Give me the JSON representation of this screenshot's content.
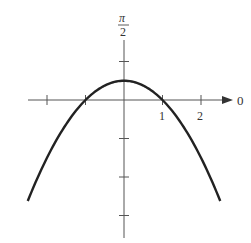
{
  "chart_data": {
    "type": "line",
    "title": "",
    "coordinate_system": "polar",
    "equation_hint": "r = 1/(1 + sin θ)",
    "polar_axis_label": "0",
    "vertical_axis_label": {
      "numerator": "π",
      "denominator": "2"
    },
    "x_tick_labels": [
      "1",
      "2"
    ],
    "x_ticks": [
      -2,
      -1,
      1,
      2
    ],
    "y_ticks": [
      1,
      -1,
      -2,
      -3
    ],
    "xlim": [
      -2.5,
      2.5
    ],
    "ylim": [
      -3.5,
      1.6
    ],
    "series": [
      {
        "name": "curve",
        "x": [
          -2.5,
          -2,
          -1.5,
          -1,
          -0.5,
          0,
          0.5,
          1,
          1.5,
          2,
          2.5
        ],
        "y": [
          -2.625,
          -1.5,
          -0.625,
          0,
          0.375,
          0.5,
          0.375,
          0,
          -0.625,
          -1.5,
          -2.625
        ]
      }
    ],
    "grid": false,
    "legend": null
  }
}
